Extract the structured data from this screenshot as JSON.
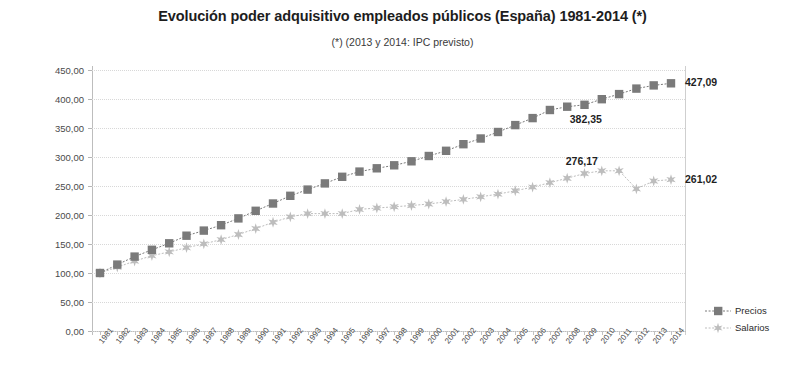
{
  "chart_data": {
    "type": "line",
    "title": "Evolución poder adquisitivo empleados públicos (España) 1981-2014 (*)",
    "subtitle": "(*) (2013 y 2014: IPC previsto)",
    "xlabel": "",
    "ylabel": "",
    "ylim": [
      0,
      450
    ],
    "ytick_step": 50,
    "grid": true,
    "legend_position": "right-bottom",
    "ytick_labels": [
      "450,00",
      "400,00",
      "350,00",
      "300,00",
      "250,00",
      "200,00",
      "150,00",
      "100,00",
      "50,00",
      "0,00"
    ],
    "categories": [
      "1981",
      "1982",
      "1983",
      "1984",
      "1985",
      "1986",
      "1987",
      "1988",
      "1989",
      "1990",
      "1991",
      "1992",
      "1993",
      "1994",
      "1995",
      "1996",
      "1997",
      "1998",
      "1999",
      "2000",
      "2001",
      "2002",
      "2003",
      "2004",
      "2005",
      "2006",
      "2007",
      "2008",
      "2009",
      "2010",
      "2011",
      "2012",
      "2013",
      "2014"
    ],
    "series": [
      {
        "name": "Precios",
        "color": "#7a7a7a",
        "marker": "square",
        "values": [
          100.0,
          114.5,
          128.3,
          140.0,
          151.2,
          164.3,
          173.1,
          182.4,
          194.2,
          207.3,
          219.8,
          233.1,
          243.8,
          254.4,
          265.9,
          274.8,
          280.5,
          285.7,
          292.6,
          301.8,
          310.7,
          322.1,
          331.9,
          343.1,
          355.0,
          367.0,
          381.0,
          386.8,
          390.0,
          399.6,
          408.5,
          418.0,
          423.5,
          427.09
        ]
      },
      {
        "name": "Salarios",
        "color": "#bdbdbd",
        "marker": "star",
        "values": [
          100.0,
          110.0,
          120.5,
          129.8,
          136.4,
          143.6,
          150.1,
          157.6,
          166.4,
          176.6,
          187.5,
          196.7,
          202.4,
          202.4,
          202.4,
          209.6,
          212.1,
          214.2,
          216.4,
          219.0,
          222.9,
          226.9,
          231.4,
          236.0,
          241.8,
          248.1,
          255.7,
          263.4,
          271.6,
          276.17,
          276.17,
          245.2,
          258.6,
          261.02
        ]
      }
    ],
    "data_labels": [
      {
        "text": "427,09",
        "series": "Precios",
        "year": "2014"
      },
      {
        "text": "382,35",
        "series": "Precios",
        "year": "2010"
      },
      {
        "text": "276,17",
        "series": "Salarios",
        "year": "2010"
      },
      {
        "text": "261,02",
        "series": "Salarios",
        "year": "2014"
      }
    ],
    "legend": [
      {
        "label": "Precios",
        "color": "#7a7a7a",
        "marker": "square"
      },
      {
        "label": "Salarios",
        "color": "#bdbdbd",
        "marker": "star"
      }
    ]
  }
}
